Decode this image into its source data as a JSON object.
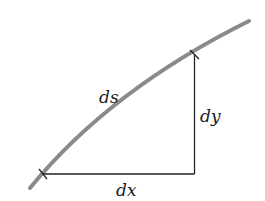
{
  "diagram": {
    "labels": {
      "hypotenuse": "ds",
      "vertical": "dy",
      "horizontal": "dx"
    },
    "colors": {
      "curve": "#8a8a8a",
      "lines": "#222222",
      "text": "#1a1a1a",
      "background": "#ffffff"
    },
    "points": {
      "curve_start": [
        30,
        188
      ],
      "curve_end": [
        249,
        21
      ],
      "lower_tick": [
        43,
        174
      ],
      "upper_tick": [
        194,
        55
      ],
      "corner": [
        194,
        174
      ]
    }
  }
}
